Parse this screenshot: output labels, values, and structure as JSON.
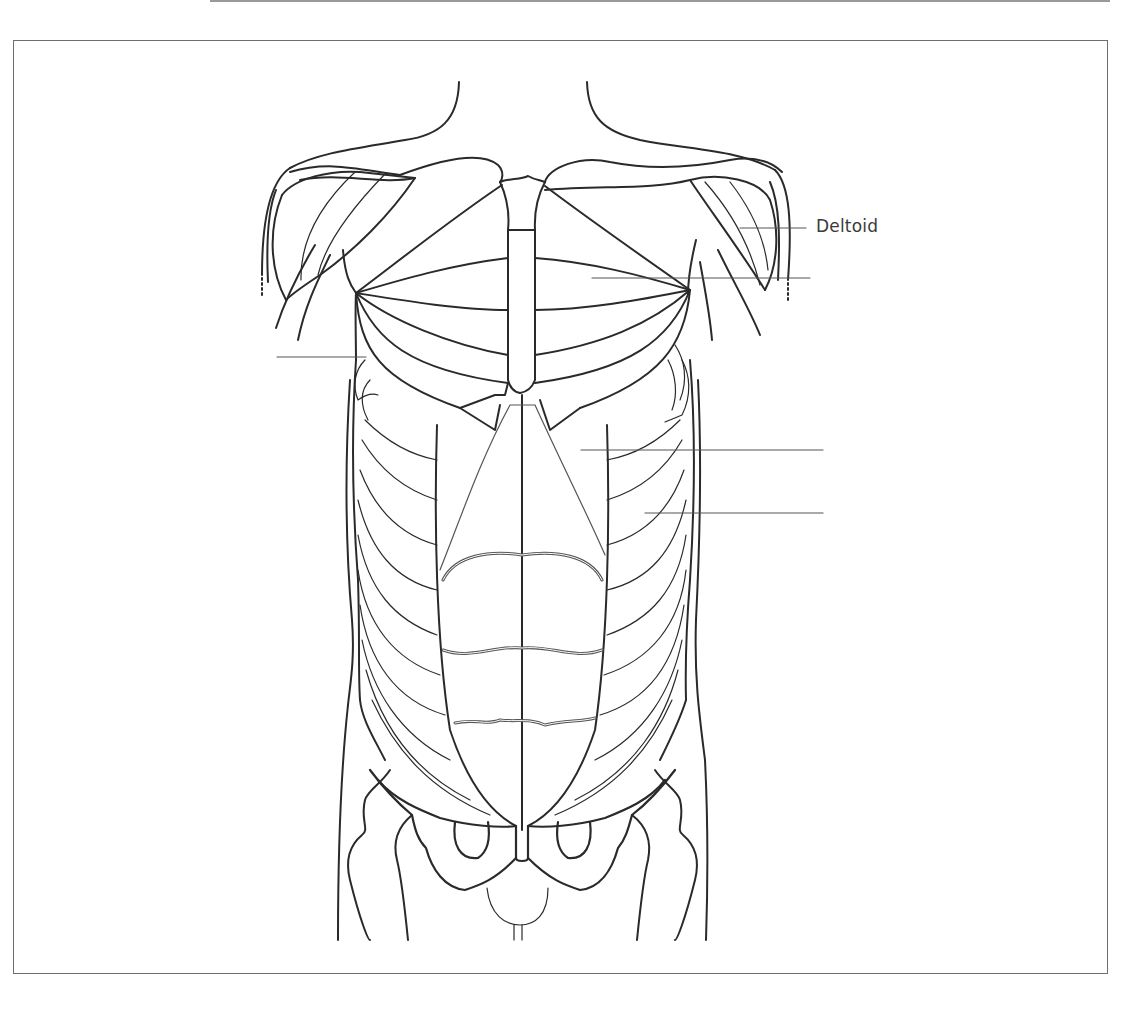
{
  "figure": {
    "stroke_color": "#2a2a2a",
    "leader_color": "#555555",
    "frame_color": "#6e6e6e"
  },
  "labels": [
    {
      "id": "deltoid",
      "text": "Deltoid",
      "x": 816,
      "y": 216
    }
  ],
  "leaders": [
    {
      "id": "deltoid-leader",
      "x1": 740,
      "y1": 228,
      "x2": 806,
      "y2": 228,
      "labelled": true
    },
    {
      "id": "pectoralis-leader",
      "x1": 592,
      "y1": 278,
      "x2": 810,
      "y2": 278,
      "labelled": false
    },
    {
      "id": "serratus-leader",
      "x1": 277,
      "y1": 357,
      "x2": 366,
      "y2": 357,
      "labelled": false
    },
    {
      "id": "rectus-abdominis-leader",
      "x1": 581,
      "y1": 450,
      "x2": 823,
      "y2": 450,
      "labelled": false
    },
    {
      "id": "external-oblique-leader",
      "x1": 645,
      "y1": 513,
      "x2": 823,
      "y2": 513,
      "labelled": false
    }
  ]
}
